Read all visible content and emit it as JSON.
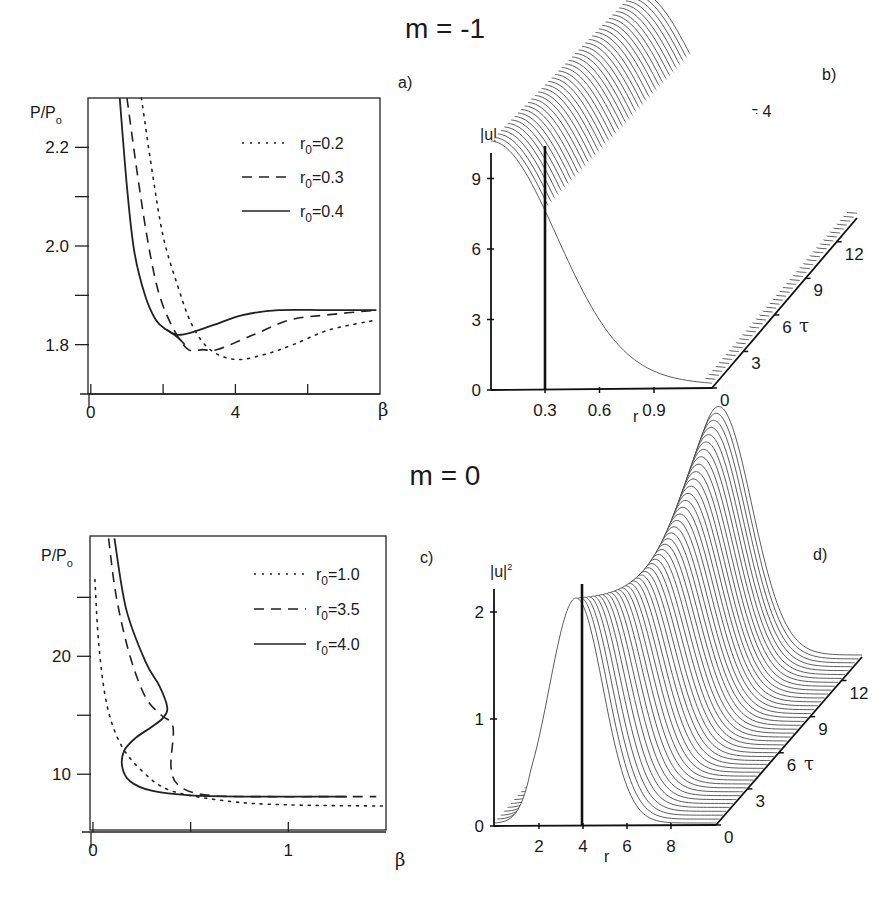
{
  "figure": {
    "top_title": "m = -1",
    "bottom_title": "m = 0"
  },
  "chart_data": [
    {
      "panel": "a)",
      "type": "line",
      "xlabel": "β",
      "ylabel": "P/P_o",
      "ylabel_main": "P/P",
      "ylabel_sub": "o",
      "xticks": [
        {
          "v": 0,
          "label": "0"
        },
        {
          "v": 2,
          "label": ""
        },
        {
          "v": 4,
          "label": "4"
        },
        {
          "v": 6,
          "label": ""
        }
      ],
      "yticks": [
        {
          "v": 2.2,
          "label": "2.2"
        },
        {
          "v": 2.1,
          "label": ""
        },
        {
          "v": 2.0,
          "label": "2.0"
        },
        {
          "v": 1.9,
          "label": ""
        },
        {
          "v": 1.8,
          "label": "1.8"
        }
      ],
      "xlim": [
        -0.05,
        8
      ],
      "ylim": [
        1.7,
        2.3
      ],
      "legend": [
        {
          "name": "r0=0.2",
          "prefix": "r",
          "sub": "0",
          "suffix": "=0.2",
          "style": "dotted"
        },
        {
          "name": "r0=0.3",
          "prefix": "r",
          "sub": "0",
          "suffix": "=0.3",
          "style": "dashed"
        },
        {
          "name": "r0=0.4",
          "prefix": "r",
          "sub": "0",
          "suffix": "=0.4",
          "style": "solid"
        }
      ],
      "series": [
        {
          "name": "r0=0.2",
          "style": "dotted",
          "x": [
            1.4,
            1.7,
            2.0,
            2.4,
            2.8,
            3.3,
            4.0,
            4.8,
            5.6,
            6.6,
            7.9
          ],
          "y": [
            2.3,
            2.15,
            2.02,
            1.92,
            1.84,
            1.79,
            1.77,
            1.78,
            1.8,
            1.83,
            1.85
          ]
        },
        {
          "name": "r0=0.3",
          "style": "dashed",
          "x": [
            1.0,
            1.3,
            1.6,
            1.9,
            2.3,
            2.7,
            3.1,
            3.5,
            4.5,
            5.5,
            6.5,
            7.9
          ],
          "y": [
            2.3,
            2.14,
            2.0,
            1.9,
            1.83,
            1.79,
            1.79,
            1.79,
            1.82,
            1.85,
            1.86,
            1.87
          ]
        },
        {
          "name": "r0=0.4",
          "style": "solid",
          "x": [
            0.8,
            1.0,
            1.2,
            1.5,
            1.8,
            2.1,
            2.4,
            2.8,
            3.4,
            4.2,
            5.2,
            6.5,
            7.9
          ],
          "y": [
            2.3,
            2.12,
            1.99,
            1.9,
            1.85,
            1.83,
            1.82,
            1.825,
            1.84,
            1.86,
            1.87,
            1.87,
            1.87
          ]
        },
        {
          "name": "r0=0.4 lower branch",
          "style": "solid",
          "x": [
            2.1,
            2.4,
            2.6
          ],
          "y": [
            1.83,
            1.815,
            1.8
          ]
        }
      ]
    },
    {
      "panel": "b)",
      "type": "surface",
      "annotation": "β = 4",
      "zlabel": "|u|",
      "xlabel": "r",
      "ylabel": "τ",
      "zticks": [
        "0",
        "3",
        "6",
        "9"
      ],
      "xticks": [
        "0.3",
        "0.6",
        "0.9"
      ],
      "tau_ticks": [
        "0",
        "3",
        "6",
        "9",
        "12"
      ],
      "marker_r": 0.3,
      "description": "Stationary profile |u|(r) along τ from 0 to 12; peak ≈ 9.6 near r≈0, decaying to ≈0 by r≈1.2 in front, ridge rises toward back"
    },
    {
      "panel": "c)",
      "type": "line",
      "xlabel": "β",
      "ylabel": "P/P_o",
      "ylabel_main": "P/P",
      "ylabel_sub": "o",
      "xticks": [
        {
          "v": 0,
          "label": "0"
        },
        {
          "v": 0.5,
          "label": ""
        },
        {
          "v": 1,
          "label": "1"
        }
      ],
      "yticks": [
        {
          "v": 25,
          "label": ""
        },
        {
          "v": 20,
          "label": "20"
        },
        {
          "v": 15,
          "label": ""
        },
        {
          "v": 10,
          "label": "10"
        }
      ],
      "xlim": [
        -0.01,
        1.5
      ],
      "ylim": [
        5.1,
        30.2
      ],
      "legend": [
        {
          "name": "r0=1.0",
          "prefix": "r",
          "sub": "0",
          "suffix": "=1.0",
          "style": "dotted"
        },
        {
          "name": "r0=3.5",
          "prefix": "r",
          "sub": "0",
          "suffix": "=3.5",
          "style": "dashed"
        },
        {
          "name": "r0=4.0",
          "prefix": "r",
          "sub": "0",
          "suffix": "=4.0",
          "style": "solid"
        }
      ],
      "series": [
        {
          "name": "r0=1.0",
          "style": "dotted",
          "x": [
            0.01,
            0.03,
            0.07,
            0.14,
            0.25,
            0.4,
            0.7,
            1.0,
            1.5
          ],
          "y": [
            26.5,
            21,
            16,
            12.6,
            10.3,
            8.6,
            7.7,
            7.4,
            7.3
          ]
        },
        {
          "name": "r0=3.5",
          "style": "dashed",
          "x": [
            0.08,
            0.12,
            0.19,
            0.27,
            0.35,
            0.41,
            0.4,
            0.45,
            0.6,
            0.9,
            1.2,
            1.45
          ],
          "y": [
            30,
            25,
            20,
            16.5,
            15,
            14,
            10.5,
            8.9,
            8.2,
            8.1,
            8.1,
            8.1
          ]
        },
        {
          "name": "r0=4.0",
          "style": "solid",
          "x": [
            0.11,
            0.17,
            0.27,
            0.34,
            0.38,
            0.36,
            0.3,
            0.22,
            0.16,
            0.15,
            0.19,
            0.3,
            0.5,
            0.8,
            1.3
          ],
          "y": [
            30,
            24,
            19.5,
            17.5,
            15.7,
            14.8,
            14.0,
            13.1,
            12,
            10.6,
            9.4,
            8.6,
            8.2,
            8.1,
            8.1
          ]
        }
      ]
    },
    {
      "panel": "d)",
      "type": "surface",
      "annotation": "β = 0.3",
      "zlabel": "|u|",
      "zlabel_sup": "2",
      "xlabel": "r",
      "ylabel": "τ",
      "zticks": [
        "0",
        "1",
        "2"
      ],
      "xticks": [
        "2",
        "4",
        "6",
        "8"
      ],
      "tau_ticks": [
        "0",
        "3",
        "6",
        "9",
        "12"
      ],
      "marker_r": 4,
      "description": "Ring profile |u|^2(r) along τ from 0 to 12; peak ≈ 2.2 near r≈4, breathing ridge"
    }
  ],
  "panels": {
    "a": {
      "label": "a)"
    },
    "b": {
      "label": "b)",
      "annotation": "β = 4",
      "zlabel": "|u|",
      "r_label": "r",
      "tau_label": "τ"
    },
    "c": {
      "label": "c)"
    },
    "d": {
      "label": "d)",
      "annotation": "β = 0.3",
      "zlabel": "|u|",
      "zlabel_sup": "2",
      "r_label": "r",
      "tau_label": "τ"
    }
  }
}
